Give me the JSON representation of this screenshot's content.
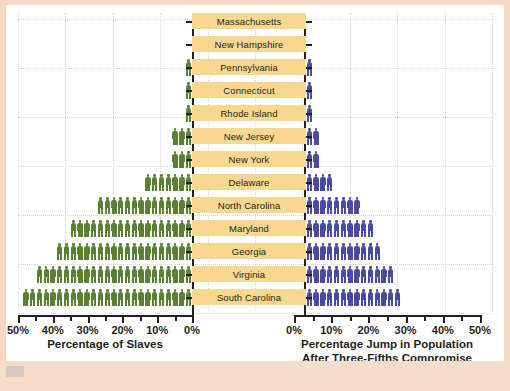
{
  "figure": {
    "background_color": "#f6d9c4",
    "canvas_color": "#ffffff",
    "label_band_color": "#f8d88f",
    "left_series_color": "#5a8033",
    "right_series_color": "#4a4a9e",
    "axis_color": "#231f20"
  },
  "chart_data": {
    "type": "bar",
    "title": "",
    "subtitle": "",
    "orientation": "horizontal-diverging-pictogram",
    "grid": true,
    "legend": "none",
    "categories": [
      "Massachusetts",
      "New Hampshire",
      "Pennsylvania",
      "Connecticut",
      "Rhode Island",
      "New Jersey",
      "New York",
      "Delaware",
      "North Carolina",
      "Maryland",
      "Georgia",
      "Virginia",
      "South Carolina"
    ],
    "series": [
      {
        "name": "Percentage of Slaves",
        "side": "left",
        "color": "#5a8033",
        "unit": "%",
        "axis_direction": "right-to-left",
        "xlim": [
          0,
          50
        ],
        "xticks": [
          0,
          10,
          20,
          30,
          40,
          50
        ],
        "xticklabels": [
          "0%",
          "10%",
          "20%",
          "30%",
          "40%",
          "50%"
        ],
        "values": [
          0,
          0,
          2,
          2,
          2,
          6,
          6,
          15,
          27,
          37,
          40,
          46,
          50
        ],
        "icons": [
          0,
          0,
          1,
          1,
          1,
          3,
          3,
          7,
          14,
          18,
          20,
          23,
          25
        ]
      },
      {
        "name": "Percentage Jump in Population After Three-Fifths Compromise",
        "side": "right",
        "color": "#4a4a9e",
        "unit": "%",
        "axis_direction": "left-to-right",
        "xlim": [
          0,
          50
        ],
        "xticks": [
          0,
          10,
          20,
          30,
          40,
          50
        ],
        "xticklabels": [
          "0%",
          "10%",
          "20%",
          "30%",
          "40%",
          "50%"
        ],
        "values": [
          0,
          0,
          2,
          2,
          2,
          4,
          4,
          8,
          16,
          21,
          23,
          28,
          29
        ],
        "icons": [
          0,
          0,
          1,
          1,
          1,
          2,
          2,
          4,
          8,
          10,
          11,
          13,
          14
        ]
      }
    ]
  },
  "left_axis": {
    "title": "Percentage of Slaves",
    "ticklabels": [
      "50%",
      "40%",
      "30%",
      "20%",
      "10%",
      "0%"
    ]
  },
  "right_axis": {
    "title_line1": "Percentage Jump in Population",
    "title_line2": "After Three-Fifths Compromise",
    "ticklabels": [
      "0%",
      "10%",
      "20%",
      "30%",
      "40%",
      "50%"
    ]
  }
}
